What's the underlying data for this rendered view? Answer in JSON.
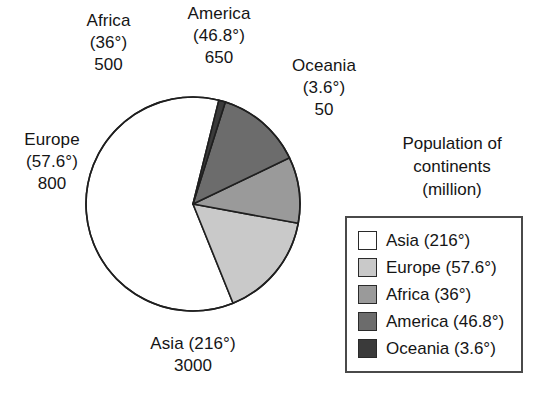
{
  "chart_data": {
    "type": "pie",
    "title": "Population of continents (million)",
    "title_lines": [
      "Population of",
      "continents",
      "(million)"
    ],
    "unit": "million",
    "categories": [
      "Asia",
      "Europe",
      "Africa",
      "America",
      "Oceania"
    ],
    "values": [
      3000,
      800,
      500,
      650,
      50
    ],
    "angles_deg": [
      216,
      57.6,
      36,
      46.8,
      3.6
    ],
    "total": 5000,
    "total_angle_deg": 360,
    "colors": [
      "#ffffff",
      "#c9c9c9",
      "#9a9a9a",
      "#6c6c6c",
      "#3a3a3a"
    ],
    "grid": false,
    "legend_position": "right",
    "start_angle_deg": -76,
    "direction": "counterclockwise",
    "slices": [
      {
        "name": "Asia",
        "value": 3000,
        "angle_deg": 216,
        "color": "#ffffff"
      },
      {
        "name": "Europe",
        "value": 800,
        "angle_deg": 57.6,
        "color": "#c9c9c9"
      },
      {
        "name": "Africa",
        "value": 500,
        "angle_deg": 36,
        "color": "#9a9a9a"
      },
      {
        "name": "America",
        "value": 650,
        "angle_deg": 46.8,
        "color": "#6c6c6c"
      },
      {
        "name": "Oceania",
        "value": 50,
        "angle_deg": 3.6,
        "color": "#3a3a3a"
      }
    ]
  },
  "callouts": {
    "africa": {
      "name": "Africa",
      "angle": "(36°)",
      "value": "500"
    },
    "america": {
      "name": "America",
      "angle": "(46.8°)",
      "value": "650"
    },
    "oceania": {
      "name": "Oceania",
      "angle": "(3.6°)",
      "value": "50"
    },
    "europe": {
      "name": "Europe",
      "angle": "(57.6°)",
      "value": "800"
    },
    "asia": {
      "name": "Asia (216°)",
      "value": "3000"
    }
  },
  "legend": {
    "title_lines": [
      "Population of",
      "continents",
      "(million)"
    ],
    "entries": [
      {
        "label": "Asia (216°)",
        "color": "#ffffff"
      },
      {
        "label": "Europe (57.6°)",
        "color": "#c9c9c9"
      },
      {
        "label": "Africa (36°)",
        "color": "#9a9a9a"
      },
      {
        "label": "America (46.8°)",
        "color": "#6c6c6c"
      },
      {
        "label": "Oceania (3.6°)",
        "color": "#3a3a3a"
      }
    ]
  },
  "pie_geometry": {
    "center_x": 193,
    "center_y": 204,
    "radius": 107,
    "stroke": "#1f1f1f"
  }
}
